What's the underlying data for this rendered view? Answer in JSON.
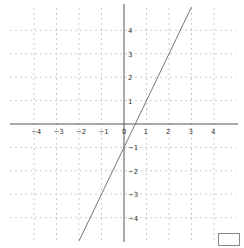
{
  "chart_data": {
    "type": "line",
    "title": "",
    "xlabel": "",
    "ylabel": "",
    "xlim": [
      -5,
      5
    ],
    "ylim": [
      -5,
      5
    ],
    "grid": true,
    "x_ticks": [
      -4,
      -3,
      -2,
      -1,
      0,
      1,
      2,
      3,
      4
    ],
    "y_ticks": [
      -4,
      -3,
      -2,
      -1,
      1,
      2,
      3,
      4
    ],
    "x_tick_labels": [
      "−4",
      "−3",
      "−2",
      "−1",
      "0",
      "1",
      "2",
      "3",
      "4"
    ],
    "y_tick_labels": [
      "−4",
      "−3",
      "−2",
      "−1",
      "1",
      "2",
      "3",
      "4"
    ],
    "series": [
      {
        "name": "y = 2x − 1",
        "x": [
          -2,
          3
        ],
        "y": [
          -5,
          5
        ],
        "color": "#777777"
      }
    ],
    "legend": null
  },
  "colors": {
    "axis": "#555555",
    "grid": "#cccccc",
    "line": "#777777"
  }
}
